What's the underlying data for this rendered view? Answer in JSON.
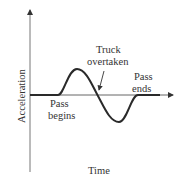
{
  "diagram": {
    "type": "line-sketch",
    "axes": {
      "y_label": "Acceleration",
      "x_label": "Time",
      "color": "#555555"
    },
    "curve": {
      "color": "#2a2a2a",
      "description": "Acceleration zero, rises to positive peak, crosses zero, dips to negative trough, returns to zero"
    },
    "annotations": [
      {
        "id": "pass_begins",
        "line1": "Pass",
        "line2": "begins"
      },
      {
        "id": "truck_overtaken",
        "line1": "Truck",
        "line2": "overtaken"
      },
      {
        "id": "pass_ends",
        "line1": "Pass",
        "line2": "ends"
      }
    ]
  }
}
